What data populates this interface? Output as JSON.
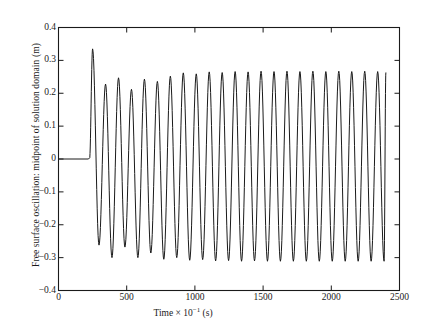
{
  "chart_data": {
    "type": "line",
    "title": "",
    "xlabel": "Time × 10⁻¹ (s)",
    "xlabel_parts": {
      "prefix": "Time × 10",
      "exponent": "−1",
      "suffix": " (s)"
    },
    "ylabel": "Free surface oscillation: midpoint of solution domain (m)",
    "xlim": [
      0,
      2500
    ],
    "ylim": [
      -0.4,
      0.4
    ],
    "xticks": [
      0,
      500,
      1000,
      1500,
      2000,
      2500
    ],
    "xtick_labels": [
      "0",
      "500",
      "1000",
      "1500",
      "2000",
      "2500"
    ],
    "yticks": [
      0.4,
      0.3,
      0.2,
      0.1,
      0,
      -0.1,
      -0.2,
      -0.3,
      -0.4
    ],
    "ytick_labels": [
      "0.4",
      "0.3",
      "0.2",
      "0.1",
      "0",
      "−0.1",
      "−0.2",
      "−0.3",
      "−0.4"
    ],
    "grid": false,
    "legend": null,
    "line_color": "#1a1a1a",
    "line_width": 1.0,
    "frame_color": "#1a1a1a",
    "background": "#ffffff",
    "series": [
      {
        "name": "free surface elevation at midpoint",
        "quiescent_until_x": 220,
        "quiescent_value": 0.0,
        "period": 95,
        "first_peak_x": 250,
        "last_x": 2400,
        "peaks": [
          {
            "x": 250,
            "y": 0.335
          },
          {
            "x": 345,
            "y": 0.228
          },
          {
            "x": 440,
            "y": 0.247
          },
          {
            "x": 535,
            "y": 0.212
          },
          {
            "x": 630,
            "y": 0.243
          },
          {
            "x": 725,
            "y": 0.236
          },
          {
            "x": 820,
            "y": 0.252
          },
          {
            "x": 915,
            "y": 0.262
          },
          {
            "x": 1010,
            "y": 0.259
          },
          {
            "x": 1105,
            "y": 0.265
          },
          {
            "x": 1200,
            "y": 0.263
          },
          {
            "x": 1295,
            "y": 0.266
          },
          {
            "x": 1390,
            "y": 0.265
          },
          {
            "x": 1485,
            "y": 0.267
          },
          {
            "x": 1580,
            "y": 0.266
          },
          {
            "x": 1675,
            "y": 0.267
          },
          {
            "x": 1770,
            "y": 0.266
          },
          {
            "x": 1865,
            "y": 0.267
          },
          {
            "x": 1960,
            "y": 0.266
          },
          {
            "x": 2055,
            "y": 0.267
          },
          {
            "x": 2150,
            "y": 0.266
          },
          {
            "x": 2245,
            "y": 0.267
          },
          {
            "x": 2340,
            "y": 0.266
          },
          {
            "x": 2400,
            "y": 0.262
          }
        ],
        "troughs": [
          {
            "x": 297,
            "y": -0.262
          },
          {
            "x": 392,
            "y": -0.3
          },
          {
            "x": 487,
            "y": -0.268
          },
          {
            "x": 582,
            "y": -0.3
          },
          {
            "x": 677,
            "y": -0.286
          },
          {
            "x": 772,
            "y": -0.305
          },
          {
            "x": 867,
            "y": -0.3
          },
          {
            "x": 962,
            "y": -0.308
          },
          {
            "x": 1057,
            "y": -0.306
          },
          {
            "x": 1152,
            "y": -0.31
          },
          {
            "x": 1247,
            "y": -0.309
          },
          {
            "x": 1342,
            "y": -0.311
          },
          {
            "x": 1437,
            "y": -0.31
          },
          {
            "x": 1532,
            "y": -0.311
          },
          {
            "x": 1627,
            "y": -0.311
          },
          {
            "x": 1722,
            "y": -0.311
          },
          {
            "x": 1817,
            "y": -0.311
          },
          {
            "x": 1912,
            "y": -0.311
          },
          {
            "x": 2007,
            "y": -0.311
          },
          {
            "x": 2102,
            "y": -0.311
          },
          {
            "x": 2197,
            "y": -0.311
          },
          {
            "x": 2292,
            "y": -0.311
          },
          {
            "x": 2387,
            "y": -0.311
          }
        ]
      }
    ]
  }
}
